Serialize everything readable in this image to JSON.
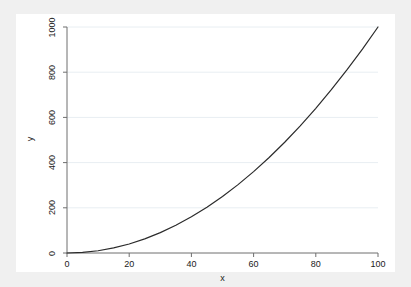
{
  "chart_data": {
    "type": "line",
    "title": "",
    "subtitle": "",
    "xlabel": "x",
    "ylabel": "y",
    "xlim": [
      0,
      100
    ],
    "ylim": [
      0,
      1000
    ],
    "xticks": [
      "0",
      "20",
      "40",
      "60",
      "80",
      "100"
    ],
    "yticks": [
      "0",
      "200",
      "400",
      "600",
      "800",
      "1000"
    ],
    "xtick_values": [
      0,
      20,
      40,
      60,
      80,
      100
    ],
    "ytick_values": [
      0,
      200,
      400,
      600,
      800,
      1000
    ],
    "grid": "horizontal",
    "legend": "none",
    "series": [
      {
        "name": "y",
        "color": "#2b2b2b",
        "x": [
          0,
          5,
          10,
          15,
          20,
          25,
          30,
          35,
          40,
          45,
          50,
          55,
          60,
          65,
          70,
          75,
          80,
          85,
          90,
          95,
          100
        ],
        "values": [
          0,
          2.5,
          10,
          22.5,
          40,
          62.5,
          90,
          122.5,
          160,
          202.5,
          250,
          302.5,
          360,
          422.5,
          490,
          562.5,
          640,
          722.5,
          810,
          902.5,
          1000
        ]
      }
    ]
  },
  "style": {
    "graph_region_color": "#f0f0f0",
    "plot_region_color": "#ffffff",
    "axis_color": "#6e6e6e",
    "grid_color": "#e8eef2",
    "line_color": "#2b2b2b",
    "text_color": "#1a1a1a"
  }
}
